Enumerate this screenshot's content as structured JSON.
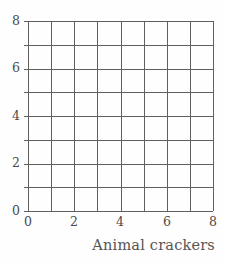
{
  "chart_data": {
    "type": "table",
    "title": "",
    "subtitle": "",
    "xlabel": "Animal crackers",
    "ylabel": "",
    "xlim": [
      0,
      8
    ],
    "ylim": [
      0,
      8
    ],
    "x_ticks": [
      0,
      2,
      4,
      6,
      8
    ],
    "y_ticks": [
      0,
      2,
      4,
      6,
      8
    ],
    "x_tick_labels": [
      "0",
      "2",
      "4",
      "6",
      "8"
    ],
    "y_tick_labels": [
      "0",
      "2",
      "4",
      "6",
      "8"
    ],
    "x_minor_step": 1,
    "y_minor_step": 1,
    "grid": true,
    "grid_columns": 8,
    "grid_rows": 8,
    "legend": null,
    "series": [],
    "values": [],
    "categories": [],
    "annotations": [],
    "note": "Empty 8 by 8 coordinate grid; no data plotted"
  },
  "style": {
    "grid_line_color": "#5f5f5f",
    "axis_line_color": "#5f5f5f",
    "tick_label_color": "#4a4a4a",
    "axis_title_color": "#555555",
    "plot_background": "#fefefe",
    "page_background": "#ffffff"
  },
  "axes": {
    "x": {
      "title": "Animal crackers",
      "ticks": [
        {
          "value": 0,
          "label": "0"
        },
        {
          "value": 2,
          "label": "2"
        },
        {
          "value": 4,
          "label": "4"
        },
        {
          "value": 6,
          "label": "6"
        },
        {
          "value": 8,
          "label": "8"
        }
      ]
    },
    "y": {
      "title": "",
      "ticks": [
        {
          "value": 8,
          "label": "8"
        },
        {
          "value": 6,
          "label": "6"
        },
        {
          "value": 4,
          "label": "4"
        },
        {
          "value": 2,
          "label": "2"
        },
        {
          "value": 0,
          "label": "0"
        }
      ]
    }
  }
}
